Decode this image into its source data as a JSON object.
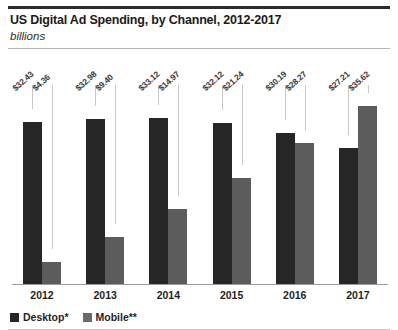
{
  "chart_data": {
    "type": "bar",
    "title": "US Digital Ad Spending, by Channel, 2012-2017",
    "subtitle": "billions",
    "xlabel": "",
    "ylabel": "",
    "ylim": [
      0,
      36
    ],
    "grid": false,
    "legend_position": "bottom-left",
    "categories": [
      "2012",
      "2013",
      "2014",
      "2015",
      "2016",
      "2017"
    ],
    "series": [
      {
        "name": "Desktop*",
        "color": "#262626",
        "values": [
          32.43,
          32.98,
          33.12,
          32.12,
          30.19,
          27.21
        ],
        "labels": [
          "$32.43",
          "$32.98",
          "$33.12",
          "$32.12",
          "$30.19",
          "$27.21"
        ]
      },
      {
        "name": "Mobile**",
        "color": "#5c5c5c",
        "values": [
          4.36,
          9.4,
          14.97,
          21.24,
          28.27,
          35.62
        ],
        "labels": [
          "$4.36",
          "$9.40",
          "$14.97",
          "$21.24",
          "$28.27",
          "$35.62"
        ]
      }
    ]
  },
  "legend": {
    "items": [
      {
        "label": "Desktop*",
        "swatch": "desktop-swatch-icon"
      },
      {
        "label": "Mobile**",
        "swatch": "mobile-swatch-icon"
      }
    ]
  }
}
